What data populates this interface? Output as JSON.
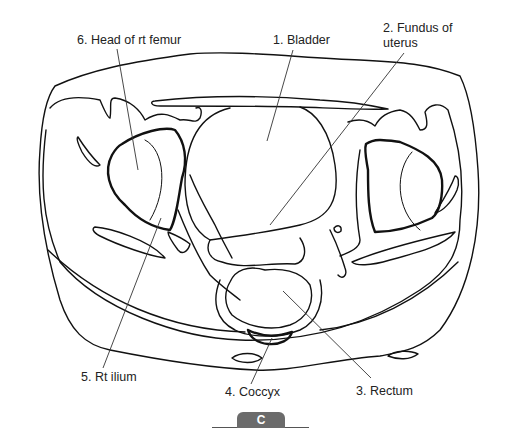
{
  "figure": {
    "panel_label": "C"
  },
  "labels": [
    {
      "id": "6",
      "text": "6. Head of rt femur"
    },
    {
      "id": "1",
      "text": "1. Bladder"
    },
    {
      "id": "2a",
      "text": "2. Fundus of"
    },
    {
      "id": "2b",
      "text": "uterus"
    },
    {
      "id": "5",
      "text": "5. Rt ilium"
    },
    {
      "id": "4",
      "text": "4. Coccyx"
    },
    {
      "id": "3",
      "text": "3. Rectum"
    }
  ],
  "colors": {
    "line": "#111111",
    "leader": "#333333",
    "tab": "#6b6b6b"
  }
}
